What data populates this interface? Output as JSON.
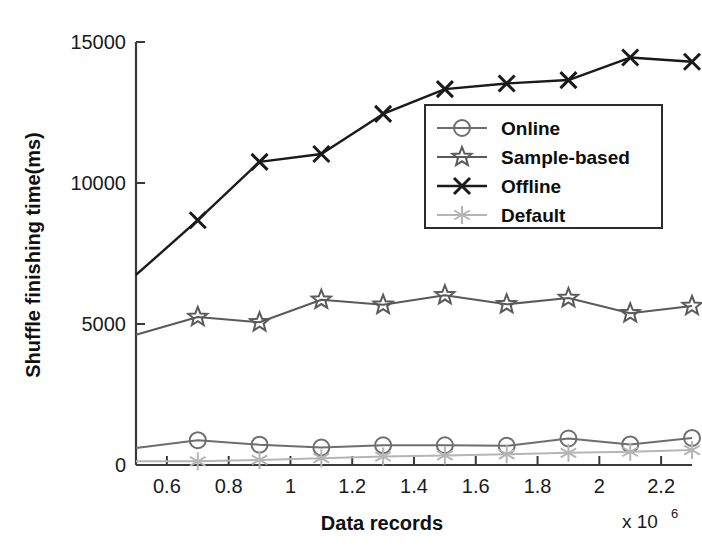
{
  "chart_data": {
    "type": "line",
    "title": "",
    "xlabel": "Data records",
    "ylabel": "Shuffle finishing time(ms)",
    "x_multiplier_base": "x 10",
    "x_multiplier_exp": "6",
    "x": [
      0.5,
      0.7,
      0.9,
      1.1,
      1.3,
      1.5,
      1.7,
      1.9,
      2.1,
      2.3
    ],
    "xlim": [
      0.5,
      2.3
    ],
    "ylim": [
      0,
      15000
    ],
    "xticks": [
      0.6,
      0.8,
      1.0,
      1.2,
      1.4,
      1.6,
      1.8,
      2.0,
      2.2
    ],
    "xtick_labels": [
      "0.6",
      "0.8",
      "1",
      "1.2",
      "1.4",
      "1.6",
      "1.8",
      "2",
      "2.2"
    ],
    "yticks": [
      0,
      5000,
      10000,
      15000
    ],
    "ytick_labels": [
      "0",
      "5000",
      "10000",
      "15000"
    ],
    "grid": false,
    "legend_position": "center-right",
    "series": [
      {
        "name": "Online",
        "marker": "circle",
        "color": "#6e6e6e",
        "values": [
          600,
          880,
          720,
          620,
          700,
          700,
          680,
          940,
          730,
          960
        ]
      },
      {
        "name": "Sample-based",
        "marker": "star",
        "color": "#5a5a5a",
        "values": [
          4620,
          5250,
          5060,
          5860,
          5680,
          6020,
          5700,
          5920,
          5380,
          5640
        ]
      },
      {
        "name": "Offline",
        "marker": "x",
        "color": "#1a1a1a",
        "values": [
          6740,
          8680,
          10750,
          11030,
          12450,
          13330,
          13530,
          13650,
          14450,
          14300
        ]
      },
      {
        "name": "Default",
        "marker": "asterisk",
        "color": "#b5b5b5",
        "values": [
          130,
          130,
          180,
          240,
          300,
          340,
          380,
          430,
          470,
          530
        ]
      }
    ]
  },
  "axes": {
    "y_axis_name": "y-axis",
    "x_axis_name": "x-axis"
  },
  "legend": {
    "items": [
      {
        "label": "Online",
        "marker": "circle",
        "color": "#6e6e6e"
      },
      {
        "label": "Sample-based",
        "marker": "star",
        "color": "#5a5a5a"
      },
      {
        "label": "Offline",
        "marker": "x",
        "color": "#1a1a1a"
      },
      {
        "label": "Default",
        "marker": "asterisk",
        "color": "#b5b5b5"
      }
    ]
  }
}
